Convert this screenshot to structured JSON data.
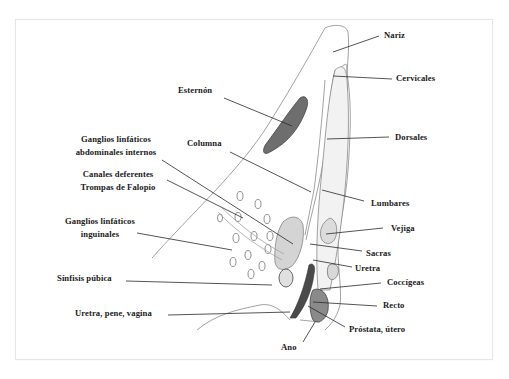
{
  "diagram": {
    "type": "anatomical-sagittal-diagram",
    "labels": {
      "nariz": "Nariz",
      "cervicales": "Cervicales",
      "esternon": "Esternón",
      "dorsales": "Dorsales",
      "ganglios_abd_1": "Ganglios linfáticos",
      "ganglios_abd_2": "abdominales internos",
      "columna": "Columna",
      "canales_1": "Canales deferentes",
      "canales_2": "Trompas de Falopio",
      "lumbares": "Lumbares",
      "ganglios_ing_1": "Ganglios linfáticos",
      "ganglios_ing_2": "inguinales",
      "vejiga": "Vejiga",
      "sacras": "Sacras",
      "uretra": "Uretra",
      "sinfisis": "Sínfisis púbica",
      "coccigeas": "Coccígeas",
      "recto": "Recto",
      "uretra_pene_vagina": "Uretra, pene, vagina",
      "prostata_utero": "Próstata, útero",
      "ano": "Ano"
    },
    "colors": {
      "line": "#2a2a2a",
      "outline": "#6a6a6a",
      "shade": "#cfcfcf",
      "dark_shade": "#555555",
      "frame": "#e6e6e6"
    }
  }
}
